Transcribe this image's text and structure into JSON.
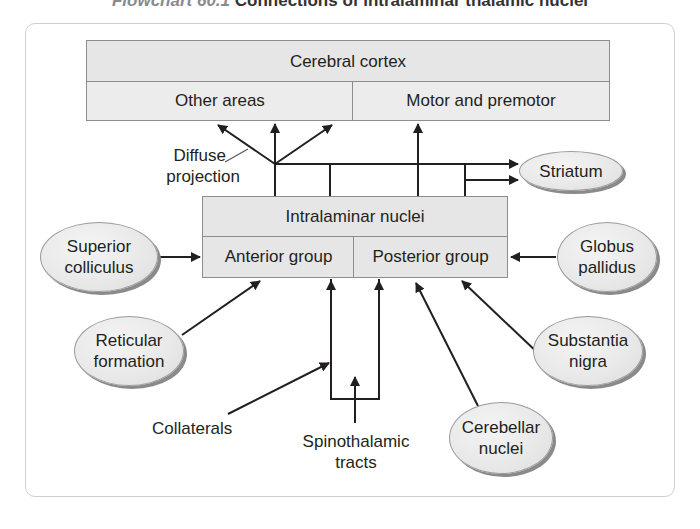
{
  "title": {
    "figure_label": "Flowchart 60.1",
    "caption": "Connections of intralaminar thalamic nuclei"
  },
  "cortex": {
    "header": "Cerebral cortex",
    "left": "Other areas",
    "right": "Motor and premotor"
  },
  "intralaminar": {
    "header": "Intralaminar nuclei",
    "left": "Anterior group",
    "right": "Posterior group"
  },
  "nodes": {
    "striatum": "Striatum",
    "superior_colliculus": [
      "Superior",
      "colliculus"
    ],
    "globus_pallidus": [
      "Globus",
      "pallidus"
    ],
    "reticular_formation": [
      "Reticular",
      "formation"
    ],
    "substantia_nigra": [
      "Substantia",
      "nigra"
    ],
    "cerebellar_nuclei": [
      "Cerebellar",
      "nuclei"
    ]
  },
  "labels": {
    "diffuse_projection": [
      "Diffuse",
      "projection"
    ],
    "collaterals": "Collaterals",
    "spinothalamic": [
      "Spinothalamic",
      "tracts"
    ]
  },
  "colors": {
    "box_fill": "#e6e6e6",
    "box_border": "#8d8d8d",
    "ellipse_fill": "#eaeaea",
    "ellipse_shadow": "#8a8a8a",
    "line": "#231f20",
    "frame": "#cfcfcf"
  }
}
